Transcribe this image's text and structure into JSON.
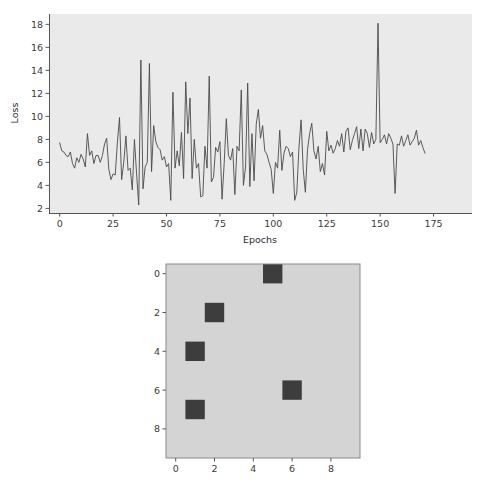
{
  "figure": {
    "background": "#ffffff",
    "width": 491,
    "height": 497
  },
  "chart_data": [
    {
      "type": "line",
      "title": "",
      "xlabel": "Epochs",
      "ylabel": "Loss",
      "xlim": [
        -5,
        193
      ],
      "ylim": [
        1.6,
        18.9
      ],
      "xticks": [
        0,
        25,
        50,
        75,
        100,
        125,
        150,
        175
      ],
      "yticks": [
        2,
        4,
        6,
        8,
        10,
        12,
        14,
        16,
        18
      ],
      "grid": false,
      "legend": null,
      "axes_facecolor": "#eaeaea",
      "line_color": "#4a4a4a",
      "series": [
        {
          "name": "Loss",
          "x": [
            0,
            1,
            2,
            3,
            4,
            5,
            6,
            7,
            8,
            9,
            10,
            11,
            12,
            13,
            14,
            15,
            16,
            17,
            18,
            19,
            20,
            21,
            22,
            23,
            24,
            25,
            26,
            27,
            28,
            29,
            30,
            31,
            32,
            33,
            34,
            35,
            36,
            37,
            38,
            39,
            40,
            41,
            42,
            43,
            44,
            45,
            46,
            47,
            48,
            49,
            50,
            51,
            52,
            53,
            54,
            55,
            56,
            57,
            58,
            59,
            60,
            61,
            62,
            63,
            64,
            65,
            66,
            67,
            68,
            69,
            70,
            71,
            72,
            73,
            74,
            75,
            76,
            77,
            78,
            79,
            80,
            81,
            82,
            83,
            84,
            85,
            86,
            87,
            88,
            89,
            90,
            91,
            92,
            93,
            94,
            95,
            96,
            97,
            98,
            99,
            100,
            101,
            102,
            103,
            104,
            105,
            106,
            107,
            108,
            109,
            110,
            111,
            112,
            113,
            114,
            115,
            116,
            117,
            118,
            119,
            120,
            121,
            122,
            123,
            124,
            125,
            126,
            127,
            128,
            129,
            130,
            131,
            132,
            133,
            134,
            135,
            136,
            137,
            138,
            139,
            140,
            141,
            142,
            143,
            144,
            145,
            146,
            147,
            148,
            149,
            150,
            151,
            152,
            153,
            154,
            155,
            156,
            157,
            158,
            159,
            160,
            161,
            162,
            163,
            164,
            165,
            166,
            167,
            168,
            169,
            170,
            171,
            172,
            173,
            174,
            175,
            176,
            177,
            178,
            179,
            180,
            181,
            182,
            183,
            184,
            185,
            186,
            187,
            188
          ],
          "y": [
            7.7,
            7.0,
            6.9,
            6.6,
            6.5,
            6.9,
            5.9,
            5.5,
            6.4,
            6.0,
            6.7,
            6.3,
            5.6,
            8.5,
            6.6,
            7.0,
            5.9,
            6.6,
            6.6,
            6.0,
            6.6,
            7.6,
            8.1,
            5.4,
            4.5,
            5.0,
            4.9,
            7.7,
            9.9,
            4.5,
            6.0,
            8.3,
            5.3,
            5.5,
            3.6,
            8.0,
            5.0,
            2.3,
            14.9,
            3.7,
            5.6,
            6.0,
            14.6,
            5.2,
            9.2,
            7.8,
            7.3,
            7.1,
            6.2,
            6.5,
            5.6,
            5.9,
            2.7,
            12.1,
            5.5,
            7.0,
            5.7,
            8.6,
            4.6,
            13.0,
            8.5,
            11.6,
            4.6,
            8.0,
            5.5,
            5.9,
            3.0,
            3.1,
            7.4,
            5.5,
            13.5,
            4.3,
            4.7,
            7.3,
            6.9,
            7.8,
            2.8,
            5.9,
            9.8,
            6.6,
            6.2,
            7.2,
            3.2,
            7.4,
            7.0,
            12.3,
            4.0,
            5.6,
            12.9,
            3.9,
            8.5,
            4.4,
            9.3,
            10.6,
            8.1,
            9.2,
            7.0,
            6.7,
            6.0,
            5.4,
            3.3,
            6.0,
            5.5,
            8.8,
            5.3,
            6.8,
            7.4,
            7.2,
            6.5,
            6.9,
            2.7,
            3.4,
            7.3,
            9.7,
            5.4,
            3.4,
            7.1,
            8.5,
            9.4,
            7.0,
            6.3,
            7.4,
            5.2,
            5.9,
            4.9,
            8.7,
            7.0,
            7.5,
            6.8,
            7.2,
            7.9,
            7.4,
            8.5,
            6.9,
            8.7,
            9.0,
            7.1,
            7.9,
            8.5,
            9.1,
            7.2,
            8.9,
            7.0,
            8.9,
            8.5,
            7.3,
            8.6,
            7.6,
            8.0,
            18.1,
            7.7,
            8.0,
            8.4,
            7.6,
            8.5,
            8.1,
            7.6,
            3.3,
            7.6,
            7.5,
            8.3,
            7.4,
            7.9,
            8.4,
            7.5,
            7.8,
            8.1,
            8.8,
            7.5,
            7.9,
            7.3,
            6.8
          ]
        }
      ]
    },
    {
      "type": "heatmap",
      "title": "",
      "xlabel": "",
      "ylabel": "",
      "xticks": [
        0,
        2,
        4,
        6,
        8
      ],
      "yticks": [
        0,
        2,
        4,
        6,
        8
      ],
      "grid": false,
      "rows": 10,
      "cols": 10,
      "cmap_low": "#d4d4d4",
      "cmap_high": "#3d3d3d",
      "active_cells": [
        {
          "row": 0,
          "col": 5
        },
        {
          "row": 2,
          "col": 2
        },
        {
          "row": 4,
          "col": 1
        },
        {
          "row": 6,
          "col": 6
        },
        {
          "row": 7,
          "col": 1
        }
      ],
      "values": [
        [
          0,
          0,
          0,
          0,
          0,
          1,
          0,
          0,
          0,
          0
        ],
        [
          0,
          0,
          0,
          0,
          0,
          0,
          0,
          0,
          0,
          0
        ],
        [
          0,
          0,
          1,
          0,
          0,
          0,
          0,
          0,
          0,
          0
        ],
        [
          0,
          0,
          0,
          0,
          0,
          0,
          0,
          0,
          0,
          0
        ],
        [
          0,
          1,
          0,
          0,
          0,
          0,
          0,
          0,
          0,
          0
        ],
        [
          0,
          0,
          0,
          0,
          0,
          0,
          0,
          0,
          0,
          0
        ],
        [
          0,
          0,
          0,
          0,
          0,
          0,
          1,
          0,
          0,
          0
        ],
        [
          0,
          1,
          0,
          0,
          0,
          0,
          0,
          0,
          0,
          0
        ],
        [
          0,
          0,
          0,
          0,
          0,
          0,
          0,
          0,
          0,
          0
        ],
        [
          0,
          0,
          0,
          0,
          0,
          0,
          0,
          0,
          0,
          0
        ]
      ]
    }
  ]
}
